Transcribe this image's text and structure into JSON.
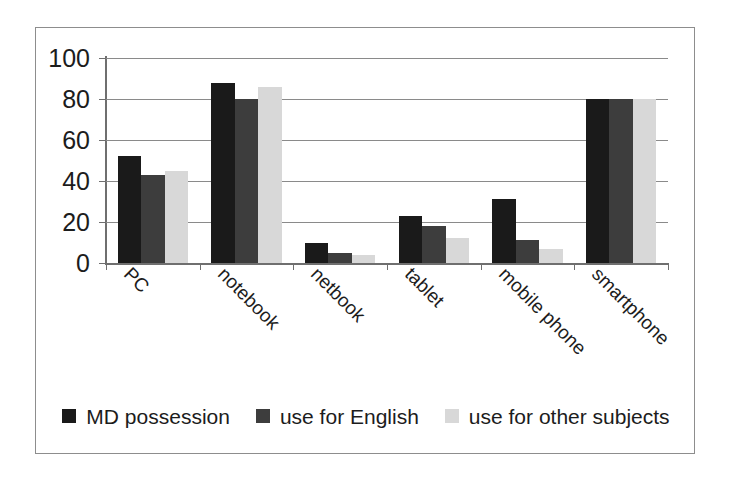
{
  "chart_data": {
    "type": "bar",
    "title": "",
    "subtitle": "",
    "xlabel": "",
    "ylabel": "",
    "categories": [
      "PC",
      "notebook",
      "netbook",
      "tablet",
      "mobile phone",
      "smartphone"
    ],
    "series": [
      {
        "name": "MD possession",
        "color": "#1a1a1a",
        "values": [
          52,
          88,
          10,
          23,
          31,
          80
        ]
      },
      {
        "name": "use for English",
        "color": "#3d3d3d",
        "values": [
          43,
          80,
          5,
          18,
          11,
          80
        ]
      },
      {
        "name": "use for other subjects",
        "color": "#d8d8d8",
        "values": [
          45,
          86,
          4,
          12,
          7,
          80
        ]
      }
    ],
    "ylim": [
      0,
      100
    ],
    "yticks": [
      0,
      20,
      40,
      60,
      80,
      100
    ],
    "ytick_labels": [
      "0",
      "20",
      "40",
      "60",
      "80",
      "100"
    ],
    "grid": true,
    "grid_axis": "y",
    "legend_position": "bottom",
    "xtick_label_rotation": 45,
    "bar_gap_ratio": 0.25
  },
  "legend": {
    "entries": [
      {
        "label": "MD possession",
        "color": "#1a1a1a"
      },
      {
        "label": "use for English",
        "color": "#3d3d3d"
      },
      {
        "label": "use for other subjects",
        "color": "#d8d8d8"
      }
    ]
  },
  "frame": {
    "border_color": "#8d8d8d",
    "background": "#ffffff"
  },
  "axis": {
    "line_color": "#6f6f6f",
    "gridline_color": "#8a8a8a",
    "text_color": "#1c1c1c"
  }
}
